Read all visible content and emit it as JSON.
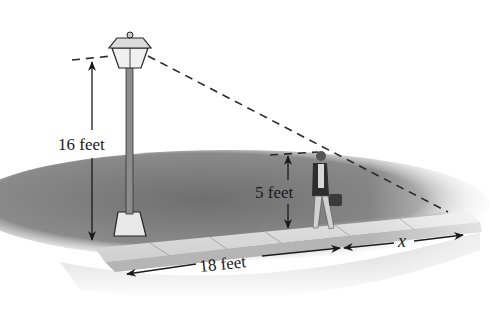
{
  "diagram": {
    "type": "related-rates illustration",
    "labels": {
      "lamp_height": "16 feet",
      "person_height": "5 feet",
      "ground_distance": "18 feet",
      "shadow_length": "x"
    },
    "objects": [
      {
        "name": "street-lamp",
        "height_ft": 16
      },
      {
        "name": "walking-person",
        "height_ft": 5
      },
      {
        "name": "sidewalk"
      },
      {
        "name": "shadow"
      },
      {
        "name": "light-ray",
        "style": "dashed"
      }
    ],
    "colors": {
      "ground": "#7a7a7a",
      "sidewalk": "#d9d9d9",
      "curb": "#b5b5b5",
      "ink": "#1a1a1a"
    }
  }
}
